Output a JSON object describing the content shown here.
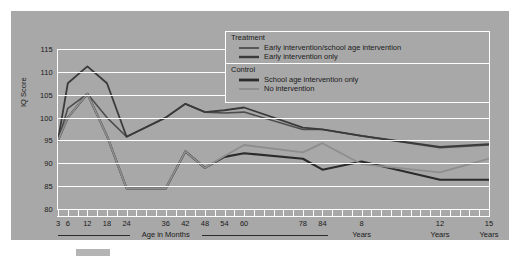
{
  "chart_data": {
    "type": "line",
    "title": "",
    "xlabel": "Age in Months",
    "ylabel": "IQ Score",
    "ylim": [
      80,
      115
    ],
    "yticks": [
      80,
      85,
      90,
      95,
      100,
      105,
      110,
      115
    ],
    "grid": true,
    "legend_position": "top-center-right",
    "x": [
      3,
      6,
      12,
      18,
      24,
      36,
      42,
      48,
      54,
      60,
      78,
      84,
      96,
      144,
      180
    ],
    "xtick_labels": [
      "3",
      "6",
      "12",
      "18",
      "24",
      "36",
      "42",
      "48",
      "54",
      "60",
      "78",
      "84",
      "8",
      "12",
      "15"
    ],
    "x_unit_labels": [
      {
        "text": "Age in Months",
        "x": 36
      },
      {
        "text": "Years",
        "x": 96
      },
      {
        "text": "Years",
        "x": 144
      },
      {
        "text": "Years",
        "x": 180
      }
    ],
    "series": [
      {
        "name": "Early intervention/school age intervention",
        "group": "Treatment",
        "color": "#4d4d4d",
        "width": 1.6,
        "values": [
          95.0,
          102.0,
          105.2,
          100.0,
          95.8,
          100.0,
          103.0,
          101.2,
          101.0,
          101.2,
          97.4,
          97.4,
          96.0,
          93.4,
          94.0
        ]
      },
      {
        "name": "Early intervention only",
        "group": "Treatment",
        "color": "#3a3a3a",
        "width": 1.8,
        "values": [
          95.0,
          107.5,
          111.2,
          107.5,
          95.8,
          100.0,
          103.0,
          101.2,
          101.6,
          102.2,
          97.8,
          97.4,
          96.0,
          93.6,
          94.2
        ]
      },
      {
        "name": "School age intervention only",
        "group": "Control",
        "color": "#2b2b2b",
        "width": 2.1,
        "values": [
          95.0,
          100.0,
          105.2,
          96.0,
          84.5,
          84.5,
          92.6,
          89.0,
          91.4,
          92.2,
          91.0,
          88.6,
          90.4,
          86.4,
          86.4
        ]
      },
      {
        "name": "No intervention",
        "group": "Control",
        "color": "#8e8e8e",
        "width": 1.8,
        "values": [
          95.0,
          100.0,
          105.2,
          96.0,
          84.5,
          84.5,
          92.6,
          89.0,
          91.6,
          94.0,
          92.4,
          94.4,
          89.8,
          88.0,
          91.0
        ]
      }
    ]
  },
  "legend": {
    "treatment_title": "Treatment",
    "control_title": "Control",
    "items": [
      {
        "label": "Early intervention/school age intervention"
      },
      {
        "label": "Early intervention only"
      },
      {
        "label": "School age intervention only"
      },
      {
        "label": "No intervention"
      }
    ]
  },
  "axis": {
    "y_title": "IQ Score",
    "y_labels": [
      "115",
      "110",
      "105",
      "100",
      "95",
      "90",
      "85",
      "80"
    ],
    "x_labels": [
      "3",
      "6",
      "12",
      "18",
      "24",
      "36",
      "42",
      "48",
      "54",
      "60",
      "78",
      "84",
      "8",
      "12",
      "15"
    ],
    "unit_month_label": "Age in Months",
    "unit_years_label_1": "Years",
    "unit_years_label_2": "Years",
    "unit_years_label_3": "Years"
  }
}
